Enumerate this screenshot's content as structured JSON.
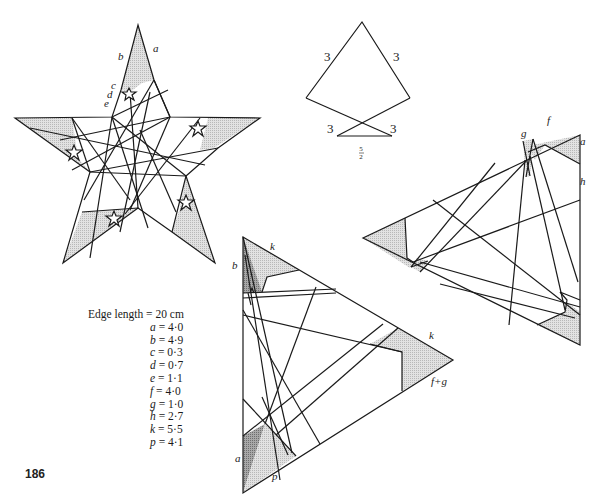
{
  "page_number": "186",
  "legend": {
    "heading": "Edge length = 20 cm",
    "items": [
      {
        "var": "a",
        "value": "4·0"
      },
      {
        "var": "b",
        "value": "4·9"
      },
      {
        "var": "c",
        "value": "0·3"
      },
      {
        "var": "d",
        "value": "0·7"
      },
      {
        "var": "e",
        "value": "1·1"
      },
      {
        "var": "f",
        "value": "4·0"
      },
      {
        "var": "g",
        "value": "1·0"
      },
      {
        "var": "h",
        "value": "2·7"
      },
      {
        "var": "k",
        "value": "5·5"
      },
      {
        "var": "p",
        "value": "4·1"
      }
    ]
  },
  "star_diagram": {
    "labels": {
      "a": "a",
      "b": "b",
      "c": "c",
      "d": "d",
      "e": "e"
    }
  },
  "kite_diagram": {
    "side_labels": [
      "3",
      "3",
      "3",
      "3"
    ],
    "base_label_num": "5",
    "base_label_den": "2"
  },
  "right_triangle": {
    "labels": {
      "f": "f",
      "g": "g",
      "a": "a",
      "h": "h"
    }
  },
  "bottom_triangle": {
    "labels": {
      "k_top": "k",
      "b": "b",
      "k_right": "k",
      "fg": "f+g",
      "a": "a",
      "p": "p"
    }
  },
  "colors": {
    "line": "#1a1a1a",
    "shade_light": "#d4d4d4",
    "shade_dark": "#9a9a9a",
    "background": "#ffffff"
  }
}
